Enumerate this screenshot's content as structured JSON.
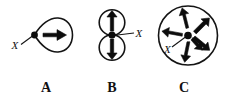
{
  "figure": {
    "background_color": "#ffffff",
    "ink_color": "#111111",
    "width": 234,
    "height": 103,
    "panels": [
      {
        "id": "A",
        "label": "A",
        "label_x": 46,
        "label_y": 92,
        "point_label": "X",
        "point_label_x": 13,
        "point_label_y": 45,
        "dot_x": 34,
        "dot_y": 35,
        "outline_shape": "teardrop",
        "arrow_count": 1,
        "arrow_directions": [
          "east"
        ]
      },
      {
        "id": "B",
        "label": "B",
        "label_x": 112,
        "label_y": 92,
        "point_label": "X",
        "point_label_x": 136,
        "point_label_y": 39,
        "dot_x": 112,
        "dot_y": 35,
        "outline_shape": "two-tangent-circles",
        "arrow_count": 2,
        "arrow_directions": [
          "north",
          "south"
        ]
      },
      {
        "id": "C",
        "label": "C",
        "label_x": 184,
        "label_y": 92,
        "point_label": "X",
        "point_label_x": 165,
        "point_label_y": 51,
        "dot_x": 188,
        "dot_y": 35,
        "outline_shape": "circle",
        "arrow_count": 6,
        "arrow_directions": [
          "north-northwest",
          "northeast",
          "west",
          "east",
          "south-southwest",
          "southeast"
        ]
      }
    ]
  }
}
